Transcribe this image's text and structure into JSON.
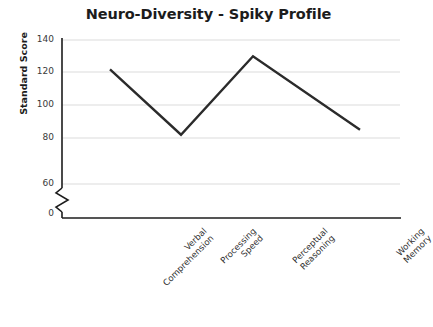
{
  "chart_data": {
    "type": "line",
    "title": "Neuro-Diversity - Spiky Profile",
    "xlabel": "",
    "ylabel": "Standard Score",
    "categories": [
      "Verbal Comprehension",
      "Processing Speed",
      "Perceptual Reasoning",
      "Working Memory"
    ],
    "category_lines": [
      [
        "Verbal",
        "Comprehension"
      ],
      [
        "Processing",
        "Speed"
      ],
      [
        "Perceptual",
        "Reasoning"
      ],
      [
        "Working",
        "Memory"
      ]
    ],
    "values": [
      122,
      82,
      130,
      85
    ],
    "series": [
      {
        "name": "Standard Score",
        "values": [
          122,
          82,
          130,
          85
        ]
      }
    ],
    "ylim": [
      0,
      140
    ],
    "yticks": [
      0,
      60,
      80,
      100,
      120,
      140
    ],
    "ytick_labels": [
      "0",
      "60",
      "80",
      "100",
      "120",
      "140"
    ],
    "axis_break": {
      "present": true,
      "between": [
        0,
        60
      ],
      "style": "zigzag"
    },
    "grid": {
      "horizontal": true,
      "vertical": false,
      "color": "#d9d9d9"
    },
    "legend": {
      "visible": false,
      "position": "none"
    },
    "colors": {
      "line": "#2b2b2b",
      "axis": "#1c1c1c",
      "grid": "#d9d9d9",
      "background": "#ffffff",
      "text": "#2b2b2b"
    },
    "line_width": 2.4,
    "markers": "none"
  }
}
